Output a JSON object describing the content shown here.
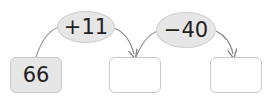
{
  "boxes": [
    {
      "value": "66",
      "filled": true
    },
    {
      "value": "",
      "filled": false
    },
    {
      "value": "",
      "filled": false
    }
  ],
  "operations": [
    {
      "label": "+11"
    },
    {
      "label": "−40"
    }
  ],
  "colors": {
    "filled_box": "#e6e6e6",
    "oval": "#e6e6e6",
    "border": "#c8c8c8",
    "arrow": "#888888"
  }
}
